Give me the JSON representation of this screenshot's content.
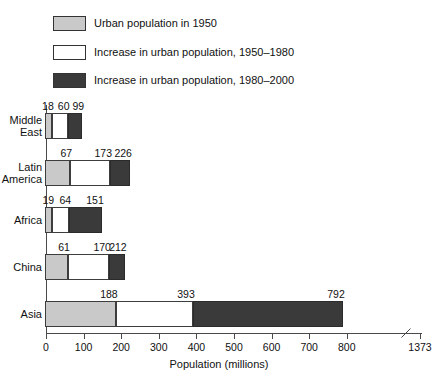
{
  "legend": {
    "items": [
      {
        "label": "Urban population in 1950",
        "swatch": "grey",
        "color": "#c9c9c9"
      },
      {
        "label": "Increase in urban population, 1950–1980",
        "swatch": "white",
        "color": "#ffffff"
      },
      {
        "label": "Increase in urban population, 1980–2000",
        "swatch": "dark",
        "color": "#3a3a3a"
      }
    ]
  },
  "chart_data": {
    "type": "bar",
    "orientation": "horizontal",
    "stacked": true,
    "title": "",
    "xlabel": "Population (millions)",
    "ylabel": "",
    "xlim": [
      0,
      900
    ],
    "xticks": [
      0,
      100,
      200,
      300,
      400,
      500,
      600,
      700,
      800,
      1373
    ],
    "xtick_labels": [
      "0",
      "100",
      "200",
      "300",
      "400",
      "500",
      "600",
      "700",
      "800",
      "1373"
    ],
    "axis_break": {
      "present": true,
      "after_tick": 800,
      "resumes_at": 1373
    },
    "grid": false,
    "legend_position": "top-left",
    "categories": [
      "Middle East",
      "Latin America",
      "Africa",
      "China",
      "Asia"
    ],
    "series": [
      {
        "name": "Urban population in 1950",
        "values": [
          18,
          67,
          19,
          61,
          188
        ]
      },
      {
        "name": "Increase in urban population, 1950–1980",
        "values": [
          42,
          106,
          45,
          109,
          205
        ]
      },
      {
        "name": "Increase in urban population, 1980–2000",
        "values": [
          39,
          53,
          87,
          42,
          399
        ]
      }
    ],
    "cumulative_labels": [
      {
        "category": "Middle East",
        "labels": [
          "18",
          "60",
          "99"
        ],
        "values": [
          18,
          60,
          99
        ]
      },
      {
        "category": "Latin America",
        "labels": [
          "67",
          "173",
          "226"
        ],
        "values": [
          67,
          173,
          226
        ]
      },
      {
        "category": "Africa",
        "labels": [
          "19",
          "64",
          "151"
        ],
        "values": [
          19,
          64,
          151
        ]
      },
      {
        "category": "China",
        "labels": [
          "61",
          "170",
          "212"
        ],
        "values": [
          61,
          170,
          212
        ]
      },
      {
        "category": "Asia",
        "labels": [
          "188",
          "393",
          "792"
        ],
        "values": [
          188,
          393,
          792
        ]
      }
    ]
  }
}
